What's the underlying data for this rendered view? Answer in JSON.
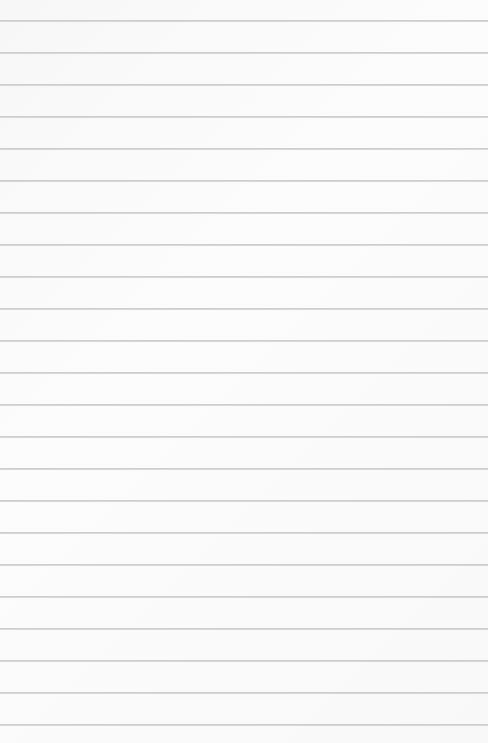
{
  "paper": {
    "kind": "lined-paper",
    "background_color": "#fafafa",
    "rule_color": "#c8c8c8",
    "first_rule_y": 21,
    "rule_spacing": 32,
    "rule_count": 23
  }
}
